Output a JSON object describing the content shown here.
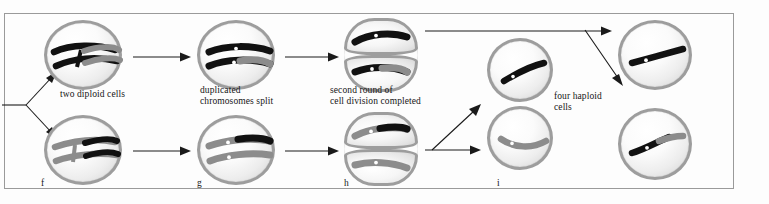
{
  "figure": {
    "border_color": "#9a9a9a",
    "background": "#fdfdfd"
  },
  "colors": {
    "chromosome_black": "#111111",
    "chromosome_gray": "#8c8c8c",
    "centromere": "#ffffff",
    "membrane": "#9d9d9d",
    "arrow": "#1a1a1a"
  },
  "labels": {
    "two_diploid_cells": "two diploid cells",
    "duplicated_line1": "duplicated",
    "duplicated_line2": "chromosomes split",
    "second_round_line1": "second round of",
    "second_round_line2": "cell division completed",
    "four_haploid_line1": "four haploid",
    "four_haploid_line2": "cells"
  },
  "stages": [
    {
      "letter": "f",
      "caption": "two diploid cells"
    },
    {
      "letter": "g",
      "caption": "duplicated chromosomes split"
    },
    {
      "letter": "h",
      "caption": "second round of cell division completed"
    },
    {
      "letter": "i",
      "caption": "four haploid cells"
    }
  ],
  "cells": [
    {
      "id": "f-top",
      "stage": "f",
      "row": "top",
      "kind": "diploid",
      "chromosomes": 2,
      "state": "duplicated-paired"
    },
    {
      "id": "f-bottom",
      "stage": "f",
      "row": "bottom",
      "kind": "diploid",
      "chromosomes": 2,
      "state": "duplicated-paired"
    },
    {
      "id": "g-top",
      "stage": "g",
      "row": "top",
      "kind": "diploid",
      "chromosomes": 2,
      "state": "chromatids-split"
    },
    {
      "id": "g-bottom",
      "stage": "g",
      "row": "bottom",
      "kind": "diploid",
      "chromosomes": 2,
      "state": "chromatids-split"
    },
    {
      "id": "h-top",
      "stage": "h",
      "row": "top",
      "kind": "dividing",
      "chromosomes": 2,
      "state": "cleavage-furrow"
    },
    {
      "id": "h-bottom",
      "stage": "h",
      "row": "bottom",
      "kind": "dividing",
      "chromosomes": 2,
      "state": "cleavage-furrow"
    },
    {
      "id": "i-upper",
      "stage": "i",
      "row": "upper",
      "kind": "haploid",
      "chromosomes": 1,
      "state": "single-chromatid"
    },
    {
      "id": "i-lower",
      "stage": "i",
      "row": "lower",
      "kind": "haploid",
      "chromosomes": 1,
      "state": "single-chromatid"
    },
    {
      "id": "final-top",
      "stage": "i",
      "row": "top",
      "kind": "haploid",
      "chromosomes": 1,
      "state": "single-chromatid"
    },
    {
      "id": "final-bot",
      "stage": "i",
      "row": "bottom",
      "kind": "haploid",
      "chromosomes": 1,
      "state": "single-chromatid"
    }
  ]
}
